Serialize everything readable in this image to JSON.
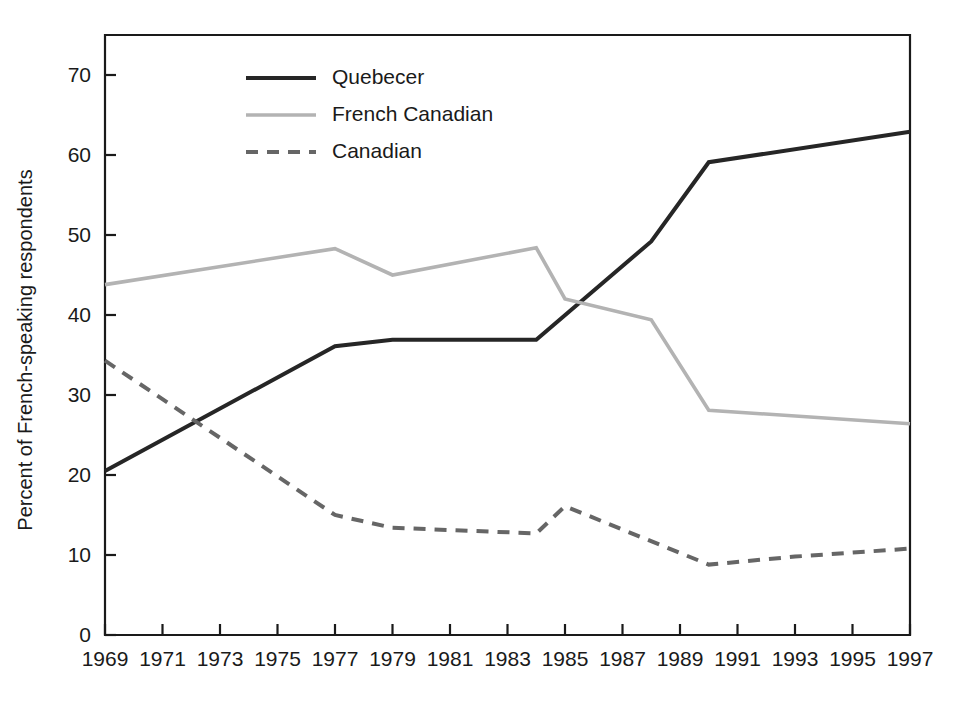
{
  "chart_data": {
    "type": "line",
    "title": "",
    "xlabel": "",
    "ylabel": "Percent of French-speaking respondents",
    "xlim": [
      1969,
      1997
    ],
    "ylim": [
      0,
      75
    ],
    "yticks": [
      0,
      10,
      20,
      30,
      40,
      50,
      60,
      70
    ],
    "xticks": [
      1969,
      1971,
      1973,
      1975,
      1977,
      1979,
      1981,
      1983,
      1985,
      1987,
      1989,
      1991,
      1993,
      1995,
      1997
    ],
    "grid": false,
    "legend_position": "top-left-inside",
    "series": [
      {
        "name": "Quebecer",
        "color": "#262626",
        "style": "solid",
        "width": 4.0,
        "points": [
          [
            1969,
            20.5
          ],
          [
            1977,
            36.1
          ],
          [
            1979,
            36.9
          ],
          [
            1984,
            36.9
          ],
          [
            1988,
            49.2
          ],
          [
            1990,
            59.1
          ],
          [
            1997,
            62.9
          ]
        ]
      },
      {
        "name": "French Canadian",
        "color": "#b3b3b3",
        "style": "solid",
        "width": 3.6,
        "points": [
          [
            1969,
            43.8
          ],
          [
            1977,
            48.3
          ],
          [
            1979,
            45.0
          ],
          [
            1984,
            48.4
          ],
          [
            1985,
            42.0
          ],
          [
            1988,
            39.4
          ],
          [
            1990,
            28.1
          ],
          [
            1997,
            26.4
          ]
        ]
      },
      {
        "name": "Canadian",
        "color": "#666666",
        "style": "dashed",
        "width": 4.0,
        "points": [
          [
            1969,
            34.3
          ],
          [
            1977,
            15.0
          ],
          [
            1979,
            13.4
          ],
          [
            1984,
            12.7
          ],
          [
            1985,
            16.1
          ],
          [
            1990,
            8.8
          ],
          [
            1993,
            9.8
          ],
          [
            1997,
            10.8
          ]
        ]
      }
    ]
  },
  "legend": {
    "items": [
      {
        "label": "Quebecer"
      },
      {
        "label": "French Canadian"
      },
      {
        "label": "Canadian"
      }
    ]
  }
}
